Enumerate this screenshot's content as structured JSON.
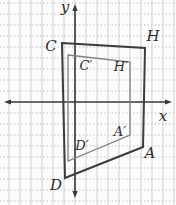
{
  "diagram": {
    "type": "coordinate-plane-geometry",
    "canvas": {
      "width": 176,
      "height": 205,
      "background": "#fcfcfc"
    },
    "grid": {
      "spacing": 11,
      "vertical": {
        "style": "solid",
        "color": "#ccd0d3",
        "start": 9
      },
      "horizontal": {
        "style": "dotted",
        "color": "#b5b5b5",
        "start": 3
      }
    },
    "axes": {
      "color": "#383838",
      "stroke_width": 1.6,
      "x_axis": {
        "label": "x",
        "y": 102,
        "from": 4,
        "to": 172,
        "label_x": 163,
        "label_y": 121
      },
      "y_axis": {
        "label": "y",
        "x": 75,
        "from": 4,
        "to": 198,
        "label_x": 65,
        "label_y": 12
      }
    },
    "label_style": {
      "color": "#2c2c2c"
    },
    "shapes": [
      {
        "id": "outer-quadrilateral",
        "vertex_names": "C, H, A, D",
        "color": "#3c3c3c",
        "stroke_width": 2,
        "label_font": 15,
        "points": [
          [
            62,
            43
          ],
          [
            145,
            48
          ],
          [
            143,
            147
          ],
          [
            65,
            178
          ]
        ],
        "labels": [
          {
            "text": "C",
            "key": "C",
            "x": 51,
            "y": 51
          },
          {
            "text": "H",
            "key": "H",
            "x": 153,
            "y": 41
          },
          {
            "text": "A",
            "key": "A",
            "x": 150,
            "y": 158
          },
          {
            "text": "D",
            "key": "D",
            "x": 56,
            "y": 190
          }
        ]
      },
      {
        "id": "inner-quadrilateral",
        "vertex_names": "C', H', A', D'",
        "color": "#818181",
        "stroke_width": 1.3,
        "label_font": 13,
        "points": [
          [
            68,
            55
          ],
          [
            130,
            62
          ],
          [
            130,
            135
          ],
          [
            68,
            161
          ]
        ],
        "labels": [
          {
            "text": "C′",
            "key": "C-prime",
            "x": 86,
            "y": 70
          },
          {
            "text": "H′",
            "key": "H-prime",
            "x": 121,
            "y": 71
          },
          {
            "text": "A′",
            "key": "A-prime",
            "x": 120,
            "y": 136
          },
          {
            "text": "D′",
            "key": "D-prime",
            "x": 82,
            "y": 150
          }
        ]
      }
    ]
  }
}
